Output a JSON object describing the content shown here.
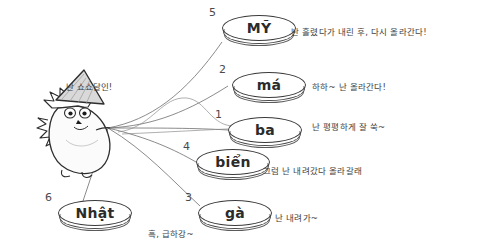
{
  "scene": {
    "title": "Vietnamese tone diagram with hedgehog character",
    "background_color": "#ffffff",
    "ink_color": "#3a3a3a"
  },
  "character": {
    "name": "hedgehog-with-conical-hat",
    "speech": "난 쇼쇼달인!",
    "hat": "non-la-conical-hat",
    "body_color": "#f2f2f2",
    "outline_color": "#2e2e2e"
  },
  "tokens": [
    {
      "number": "1",
      "word": "ba",
      "note": "난 평평하게 잘 쑥~",
      "x": 228,
      "y": 117
    },
    {
      "number": "2",
      "word": "má",
      "note": "하하~ 난 올라간다!",
      "x": 232,
      "y": 72
    },
    {
      "number": "3",
      "word": "gà",
      "note": "난 내려가~",
      "x": 198,
      "y": 200
    },
    {
      "number": "4",
      "word": "biển",
      "note": "그럼 난 내려갔다 올라갈래",
      "x": 196,
      "y": 149
    },
    {
      "number": "5",
      "word": "MỸ",
      "note": "난 흘렸다가 내린 후, 다시 올라간다!",
      "x": 222,
      "y": 15
    },
    {
      "number": "6",
      "word": "Nhật",
      "note": "흑, 급하강~",
      "x": 58,
      "y": 200
    }
  ],
  "notes_positions": [
    {
      "id": "note-5",
      "x": 291,
      "y": 25
    },
    {
      "id": "note-2",
      "x": 312,
      "y": 80
    },
    {
      "id": "note-1",
      "x": 312,
      "y": 120
    },
    {
      "id": "note-4",
      "x": 263,
      "y": 164
    },
    {
      "id": "note-3",
      "x": 275,
      "y": 211
    },
    {
      "id": "note-6",
      "x": 148,
      "y": 227
    }
  ]
}
